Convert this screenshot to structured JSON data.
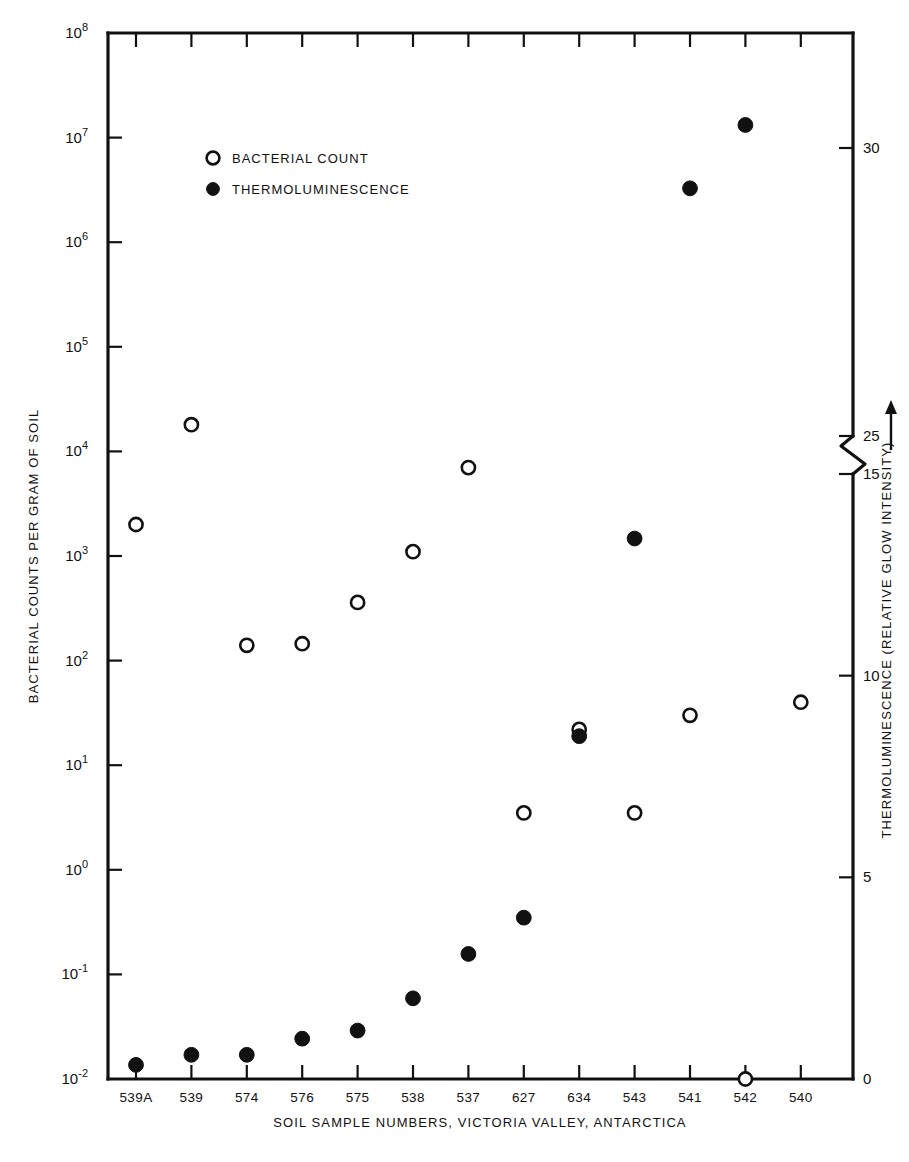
{
  "chart_data": {
    "type": "scatter",
    "title": "",
    "xlabel": "SOIL SAMPLE NUMBERS, VICTORIA VALLEY, ANTARCTICA",
    "ylabel": "BACTERIAL COUNTS PER GRAM OF SOIL",
    "y2label": "THERMOLUMINESCENCE (RELATIVE GLOW INTENSITY)",
    "y2label_arrow": "⟶",
    "categories": [
      "539A",
      "539",
      "574",
      "576",
      "575",
      "538",
      "537",
      "627",
      "634",
      "543",
      "541",
      "542",
      "540"
    ],
    "yscale": "log",
    "ylim": [
      0.01,
      100000000
    ],
    "ytick_labels": [
      "10⁻²",
      "10⁻¹",
      "10⁰",
      "10¹",
      "10²",
      "10³",
      "10⁴",
      "10⁵",
      "10⁶",
      "10⁷",
      "10⁸"
    ],
    "ytick_bases": [
      "10",
      "10",
      "10",
      "10",
      "10",
      "10",
      "10",
      "10",
      "10",
      "10",
      "10"
    ],
    "ytick_exponents": [
      "-2",
      "-1",
      "0",
      "1",
      "2",
      "3",
      "4",
      "5",
      "6",
      "7",
      "8"
    ],
    "ytick_values": [
      0.01,
      0.1,
      1,
      10,
      100,
      1000,
      10000,
      100000,
      1000000,
      10000000,
      100000000
    ],
    "y2tick_labels": [
      "0",
      "5",
      "10",
      "15",
      "25",
      "30"
    ],
    "y2tick_values": [
      0,
      5,
      10,
      15,
      25,
      30
    ],
    "y2_axis_break": true,
    "y2_break_between": [
      15,
      25
    ],
    "grid": false,
    "legend_position": "upper-left-inside",
    "series": [
      {
        "name": "BACTERIAL COUNT",
        "marker": "open-circle",
        "axis": "left",
        "values": [
          2000,
          18000,
          140,
          145,
          360,
          1100,
          7000,
          3.5,
          22,
          3.5,
          30,
          0.01,
          40
        ]
      },
      {
        "name": "THERMOLUMINESCENCE",
        "marker": "filled-circle",
        "axis": "right",
        "values": [
          0.35,
          0.6,
          0.6,
          1.0,
          1.2,
          2.0,
          3.1,
          4.0,
          8.5,
          13.4,
          29.3,
          30.4,
          33.5
        ]
      }
    ]
  },
  "legend": {
    "items": [
      {
        "label": "BACTERIAL COUNT",
        "marker": "open-circle"
      },
      {
        "label": "THERMOLUMINESCENCE",
        "marker": "filled-circle"
      }
    ]
  }
}
